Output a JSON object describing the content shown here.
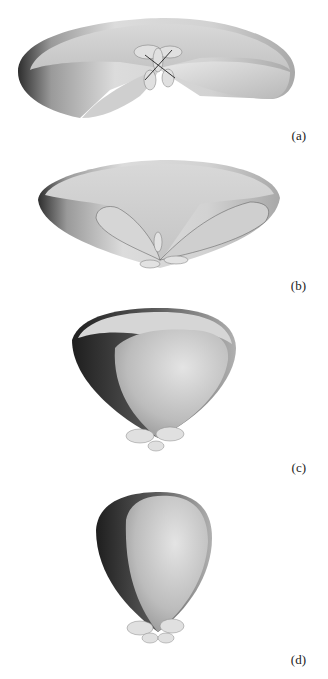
{
  "figure": {
    "panels": [
      {
        "id": "a",
        "label": "(a)",
        "shape": "flattened-torus-pattern"
      },
      {
        "id": "b",
        "label": "(b)",
        "shape": "bowl-pattern-with-two-lobes"
      },
      {
        "id": "c",
        "label": "(c)",
        "shape": "heart-shaped-pattern"
      },
      {
        "id": "d",
        "label": "(d)",
        "shape": "egg-shaped-pattern"
      }
    ],
    "colors": {
      "background": "#ffffff",
      "surface_light": "#e6e6e6",
      "surface_mid": "#bdbdbd",
      "surface_dark": "#3a3a3a"
    }
  }
}
